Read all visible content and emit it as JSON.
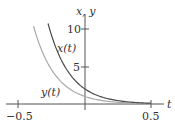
{
  "chart_data": {
    "type": "line",
    "title": "",
    "xlabel": "t",
    "ylabel": "x, y",
    "xlim": [
      -0.5,
      0.5
    ],
    "ylim": [
      0,
      10
    ],
    "grid": false,
    "legend": "inline labels",
    "x_ticks": [
      -0.5,
      0.5
    ],
    "x_tick_labels": [
      "−0.5",
      "0.5"
    ],
    "y_ticks": [
      5,
      10
    ],
    "y_tick_labels": [
      "5",
      "10"
    ],
    "series": [
      {
        "name": "x(t)",
        "label": "x(t)",
        "color": "#4a4a4a",
        "formula": "2*exp(-6t)",
        "x": [
          -0.28,
          -0.2,
          -0.1,
          0.0,
          0.1,
          0.2,
          0.3,
          0.4,
          0.5
        ],
        "y": [
          10.7,
          6.6,
          3.6,
          2.0,
          1.1,
          0.6,
          0.33,
          0.18,
          0.1
        ]
      },
      {
        "name": "y(t)",
        "label": "y(t)",
        "color": "#a8a8a8",
        "formula": "1*exp(-6t)",
        "x": [
          -0.39,
          -0.3,
          -0.2,
          -0.1,
          0.0,
          0.1,
          0.2,
          0.3,
          0.4,
          0.5
        ],
        "y": [
          10.4,
          6.0,
          3.3,
          1.8,
          1.0,
          0.55,
          0.3,
          0.17,
          0.09,
          0.05
        ]
      }
    ]
  },
  "labels": {
    "y_axis": "x, y",
    "x_axis": "t",
    "tick_neg": "−0.5",
    "tick_pos": "0.5",
    "tick_5": "5",
    "tick_10": "10",
    "series_x": "x(t)",
    "series_y": "y(t)"
  }
}
